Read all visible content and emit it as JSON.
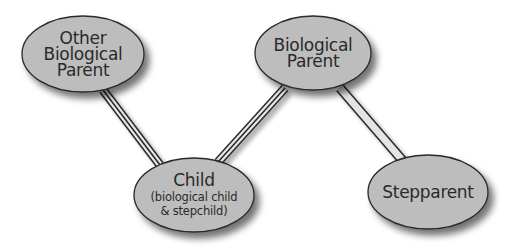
{
  "diagram": {
    "type": "relationship-diagram",
    "nodes": [
      {
        "id": "other_bio_parent",
        "lines": [
          "Other",
          "Biological",
          "Parent"
        ],
        "sub": []
      },
      {
        "id": "bio_parent",
        "lines": [
          "Biological",
          "Parent"
        ],
        "sub": []
      },
      {
        "id": "child",
        "lines": [
          "Child"
        ],
        "sub": [
          "(biological child",
          "& stepchild)"
        ]
      },
      {
        "id": "stepparent",
        "lines": [
          "Stepparent"
        ],
        "sub": []
      }
    ],
    "edges": [
      {
        "from": "other_bio_parent",
        "to": "bio_parent",
        "style": "dashed"
      },
      {
        "from": "other_bio_parent",
        "to": "child",
        "style": "triple-line"
      },
      {
        "from": "bio_parent",
        "to": "child",
        "style": "triple-line"
      },
      {
        "from": "bio_parent",
        "to": "stepparent",
        "style": "double-line"
      },
      {
        "from": "child",
        "to": "stepparent",
        "style": "dashed"
      }
    ],
    "colors": {
      "node_fill": "#bdbdbd",
      "node_stroke": "#2a2a2a",
      "dash": "#6e6e6e",
      "line": "#2a2a2a",
      "text": "#2a2a2a"
    }
  }
}
